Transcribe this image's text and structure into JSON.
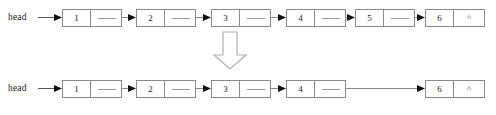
{
  "diagram": {
    "background_color": "#ffffff",
    "stroke_color": "#8a8a8a",
    "arrow_color": "#444444",
    "text_color": "#1b1b1b",
    "transition_arrow": {
      "direction": "down",
      "style": "hollow-outline",
      "icon": "arrow-down-block-icon"
    },
    "rows": [
      {
        "id": "before",
        "caption": "head",
        "nodes": [
          {
            "data": "1",
            "next": "pointer",
            "x": 62
          },
          {
            "data": "2",
            "next": "pointer",
            "x": 136
          },
          {
            "data": "3",
            "next": "pointer",
            "x": 211
          },
          {
            "data": "4",
            "next": "pointer",
            "x": 286
          },
          {
            "data": "5",
            "next": "pointer",
            "x": 355
          },
          {
            "data": "6",
            "next": "^",
            "x": 425
          }
        ],
        "links": [
          {
            "from": "head",
            "to": "1",
            "x": 38,
            "width": 24
          },
          {
            "from": "1",
            "to": "2",
            "x": 110,
            "width": 26
          },
          {
            "from": "2",
            "to": "3",
            "x": 184,
            "width": 27
          },
          {
            "from": "3",
            "to": "4",
            "x": 259,
            "width": 27
          },
          {
            "from": "4",
            "to": "5",
            "x": 334,
            "width": 21
          },
          {
            "from": "5",
            "to": "6",
            "x": 403,
            "width": 22
          }
        ]
      },
      {
        "id": "after",
        "caption": "head",
        "nodes": [
          {
            "data": "1",
            "next": "pointer",
            "x": 62
          },
          {
            "data": "2",
            "next": "pointer",
            "x": 136
          },
          {
            "data": "3",
            "next": "pointer",
            "x": 211
          },
          {
            "data": "4",
            "next": "pointer",
            "x": 286
          },
          {
            "data": "6",
            "next": "^",
            "x": 425
          }
        ],
        "links": [
          {
            "from": "head",
            "to": "1",
            "x": 38,
            "width": 24
          },
          {
            "from": "1",
            "to": "2",
            "x": 110,
            "width": 26
          },
          {
            "from": "2",
            "to": "3",
            "x": 184,
            "width": 27
          },
          {
            "from": "3",
            "to": "4",
            "x": 259,
            "width": 27
          },
          {
            "from": "4",
            "to": "6",
            "x": 334,
            "width": 91
          }
        ]
      }
    ]
  }
}
